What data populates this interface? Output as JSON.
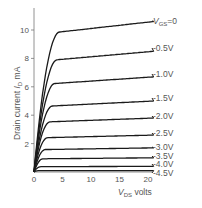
{
  "chart_data": {
    "type": "line",
    "title": "",
    "xlabel": "V_DS volts",
    "ylabel": "Drain current I_D mA",
    "xlim": [
      0,
      20
    ],
    "ylim": [
      0,
      12
    ],
    "xticks": [
      0,
      5,
      10,
      15,
      20
    ],
    "yticks": [
      2,
      4,
      6,
      8,
      10
    ],
    "grid": false,
    "legend_position": "inline-right",
    "series": [
      {
        "name": "V_GS = 0",
        "label": "VGS=0",
        "saturation_mA": 10.6
      },
      {
        "name": "-0.5 V",
        "label": "-0.5V",
        "saturation_mA": 8.5
      },
      {
        "name": "-1.0 V",
        "label": "-1.0V",
        "saturation_mA": 6.7
      },
      {
        "name": "-1.5 V",
        "label": "-1.5V",
        "saturation_mA": 5.0
      },
      {
        "name": "-2.0 V",
        "label": "-2.0V",
        "saturation_mA": 3.8
      },
      {
        "name": "-2.5 V",
        "label": "-2.5V",
        "saturation_mA": 2.6
      },
      {
        "name": "-3.0 V",
        "label": "-3.0V",
        "saturation_mA": 1.7
      },
      {
        "name": "-3.5 V",
        "label": "-3.5V",
        "saturation_mA": 1.0
      },
      {
        "name": "-4.0 V",
        "label": "-4.0V",
        "saturation_mA": 0.4
      },
      {
        "name": "-4.5 V",
        "label": "-4.5V",
        "saturation_mA": 0.1
      }
    ]
  },
  "labels": {
    "ylabel_main": "Drain current ",
    "ylabel_sym": "I",
    "ylabel_sub": "D",
    "ylabel_unit": " mA",
    "xlabel_sym": "V",
    "xlabel_sub": "DS",
    "xlabel_unit": " volts",
    "vgs_sym": "V",
    "vgs_sub": "GS",
    "vgs_val": "=0"
  }
}
